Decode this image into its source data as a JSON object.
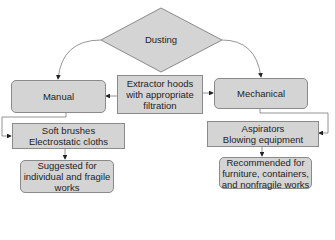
{
  "diagram": {
    "root": {
      "label": "Dusting"
    },
    "methods": [
      {
        "id": "manual",
        "label": "Manual"
      },
      {
        "id": "mechanical",
        "label": "Mechanical"
      }
    ],
    "shared": {
      "label": "Extractor hoods\nwith appropriate\nfiltration"
    },
    "tools": [
      {
        "id": "manual-tools",
        "label": "Soft brushes\nElectrostatic cloths"
      },
      {
        "id": "mechanical-tools",
        "label": "Aspirators\nBlowing equipment"
      }
    ],
    "uses": [
      {
        "id": "manual-use",
        "label": "Suggested for\nindividual and fragile\nworks"
      },
      {
        "id": "mechanical-use",
        "label": "Recommended for\nfurniture, containers,\nand nonfragile works"
      }
    ],
    "colors": {
      "fill": "#d4d4d4",
      "stroke": "#8a8a8a",
      "line": "#6e6e6e",
      "arrow": "#222222"
    }
  }
}
